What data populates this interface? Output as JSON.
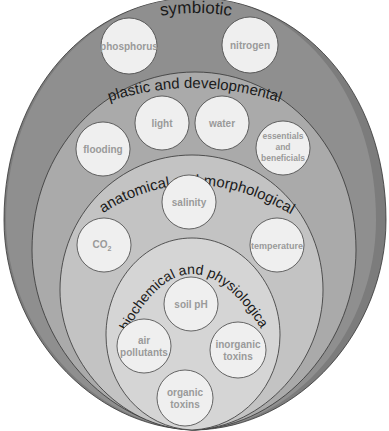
{
  "diagram": {
    "colors": {
      "symbiotic_fill": "#8c8c8c",
      "symbiotic_shadow": "#7a7a7a",
      "plastic_fill": "#aaaaaa",
      "anatomical_fill": "#c2c2c2",
      "biochemical_fill": "#d6d6d6",
      "circle_fill": "#efefef",
      "outline": "#333333",
      "factor_text": "#9a9a9a"
    },
    "layers": [
      {
        "label": "symbiotic",
        "factors": [
          "phosphorus",
          "nitrogen"
        ]
      },
      {
        "label": "plastic and developmental",
        "factors": [
          "flooding",
          "light",
          "water",
          "essentials and beneficials"
        ]
      },
      {
        "label": "anatomical and morphological",
        "factors": [
          "salinity",
          "CO2",
          "temperature"
        ]
      },
      {
        "label": "biochemical and physiological",
        "factors": [
          "soil pH",
          "air pollutants",
          "inorganic toxins",
          "organic toxins"
        ]
      }
    ],
    "factors": {
      "phosphorus": "phosphorus",
      "nitrogen": "nitrogen",
      "flooding": "flooding",
      "light": "light",
      "water": "water",
      "essentials_1": "essentials",
      "essentials_2": "and",
      "essentials_3": "beneficials",
      "salinity": "salinity",
      "co2_main": "CO",
      "co2_sub": "2",
      "temperature": "temperature",
      "soil_ph": "soil pH",
      "air_1": "air",
      "air_2": "pollutants",
      "inorganic_1": "inorganic",
      "inorganic_2": "toxins",
      "organic_1": "organic",
      "organic_2": "toxins"
    }
  }
}
